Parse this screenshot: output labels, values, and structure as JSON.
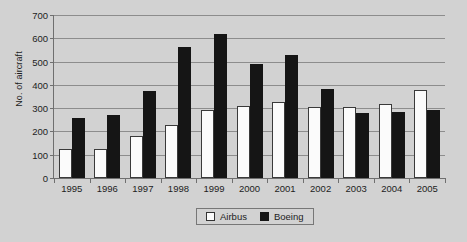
{
  "chart_data": {
    "type": "bar",
    "title": "",
    "xlabel": "",
    "ylabel": "No. of aircraft",
    "categories": [
      "1995",
      "1996",
      "1997",
      "1998",
      "1999",
      "2000",
      "2001",
      "2002",
      "2003",
      "2004",
      "2005"
    ],
    "series": [
      {
        "name": "Airbus",
        "color": "#fbfbfb",
        "values": [
          126,
          126,
          182,
          229,
          294,
          311,
          325,
          303,
          305,
          320,
          378
        ]
      },
      {
        "name": "Boeing",
        "color": "#151515",
        "values": [
          256,
          271,
          375,
          563,
          620,
          489,
          527,
          381,
          281,
          285,
          290
        ]
      }
    ],
    "ylim": [
      0,
      700
    ],
    "yticks": [
      0,
      100,
      200,
      300,
      400,
      500,
      600,
      700
    ],
    "ytick_labels": [
      "0",
      "100",
      "200",
      "300",
      "400",
      "500",
      "600",
      "700"
    ],
    "grid": true,
    "legend_position": "bottom-center"
  },
  "legend": {
    "items": [
      {
        "label": "Airbus",
        "swatch": "airbus"
      },
      {
        "label": "Boeing",
        "swatch": "boeing"
      }
    ]
  },
  "colors": {
    "background": "#d2d2d2",
    "gridline": "#8d8d8d",
    "axis": "#6f6f6f",
    "text": "#1d1d1d"
  }
}
